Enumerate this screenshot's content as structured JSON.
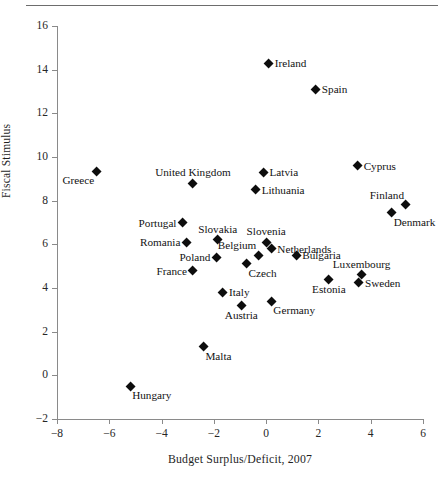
{
  "chart_data": {
    "type": "scatter",
    "title": "",
    "xlabel": "Budget Surplus/Deficit, 2007",
    "ylabel": "Fiscal Stimulus",
    "xlim": [
      -8,
      6
    ],
    "ylim": [
      -2,
      16
    ],
    "xticks": [
      "−8",
      "−6",
      "−4",
      "−2",
      "0",
      "2",
      "4",
      "6"
    ],
    "xtick_values": [
      -8,
      -6,
      -4,
      -2,
      0,
      2,
      4,
      6
    ],
    "yticks": [
      "16",
      "14",
      "12",
      "10",
      "8",
      "6",
      "4",
      "2",
      "0",
      "−2"
    ],
    "ytick_values": [
      16,
      14,
      12,
      10,
      8,
      6,
      4,
      2,
      0,
      -2
    ],
    "grid": false,
    "legend": "none",
    "marker_shape": "filled-diamond",
    "marker_color": "#0d0d0d",
    "points": [
      {
        "label": "Ireland",
        "x": 0.1,
        "y": 14.3,
        "label_pos": "right"
      },
      {
        "label": "Spain",
        "x": 1.9,
        "y": 13.1,
        "label_pos": "right"
      },
      {
        "label": "Cyprus",
        "x": 3.5,
        "y": 9.6,
        "label_pos": "right"
      },
      {
        "label": "Greece",
        "x": -6.5,
        "y": 9.35,
        "label_pos": "below-left"
      },
      {
        "label": "Latvia",
        "x": -0.1,
        "y": 9.3,
        "label_pos": "right"
      },
      {
        "label": "United Kingdom",
        "x": -2.8,
        "y": 8.8,
        "label_pos": "above"
      },
      {
        "label": "Lithuania",
        "x": -0.4,
        "y": 8.5,
        "label_pos": "right"
      },
      {
        "label": "Finland",
        "x": 5.35,
        "y": 7.8,
        "label_pos": "above-left"
      },
      {
        "label": "Denmark",
        "x": 4.8,
        "y": 7.45,
        "label_pos": "below-right"
      },
      {
        "label": "Portugal",
        "x": -3.2,
        "y": 7.0,
        "label_pos": "left"
      },
      {
        "label": "Slovakia",
        "x": -1.85,
        "y": 6.2,
        "label_pos": "above"
      },
      {
        "label": "Romania",
        "x": -3.05,
        "y": 6.1,
        "label_pos": "left"
      },
      {
        "label": "Slovenia",
        "x": 0.0,
        "y": 6.1,
        "label_pos": "above"
      },
      {
        "label": "Netherlands",
        "x": 0.2,
        "y": 5.8,
        "label_pos": "right"
      },
      {
        "label": "Belgium",
        "x": -0.3,
        "y": 5.5,
        "label_pos": "above-left"
      },
      {
        "label": "Bulgaria",
        "x": 1.15,
        "y": 5.5,
        "label_pos": "right"
      },
      {
        "label": "Poland",
        "x": -1.9,
        "y": 5.4,
        "label_pos": "left"
      },
      {
        "label": "Czech",
        "x": -0.75,
        "y": 5.1,
        "label_pos": "below-right"
      },
      {
        "label": "France",
        "x": -2.8,
        "y": 4.8,
        "label_pos": "left"
      },
      {
        "label": "Luxembourg",
        "x": 3.65,
        "y": 4.6,
        "label_pos": "above"
      },
      {
        "label": "Estonia",
        "x": 2.4,
        "y": 4.4,
        "label_pos": "below"
      },
      {
        "label": "Sweden",
        "x": 3.55,
        "y": 4.25,
        "label_pos": "right"
      },
      {
        "label": "Italy",
        "x": -1.65,
        "y": 3.8,
        "label_pos": "right"
      },
      {
        "label": "Germany",
        "x": 0.2,
        "y": 3.4,
        "label_pos": "below-right"
      },
      {
        "label": "Austria",
        "x": -0.95,
        "y": 3.2,
        "label_pos": "below"
      },
      {
        "label": "Malta",
        "x": -2.4,
        "y": 1.3,
        "label_pos": "below-right"
      },
      {
        "label": "Hungary",
        "x": -5.2,
        "y": -0.5,
        "label_pos": "below-right"
      }
    ]
  }
}
